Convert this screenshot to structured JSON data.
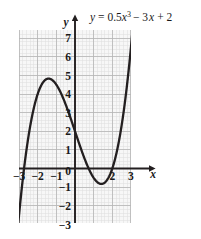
{
  "chart_data": {
    "type": "line",
    "title": "",
    "equation_label": "y = 0.5x³ − 3x + 2",
    "equation_parts": {
      "y": "y",
      "equals": "= 0.5",
      "x1": "x",
      "exp": "3",
      "mid": "− 3",
      "x2": "x",
      "end": "+ 2"
    },
    "function": "y = 0.5*x^3 - 3*x + 2",
    "xlabel": "x",
    "ylabel": "y",
    "xlim": [
      -3.2,
      3.35
    ],
    "ylim": [
      -3.2,
      7.3
    ],
    "x_ticks": [
      -3,
      -2,
      -1,
      0,
      2,
      3
    ],
    "x_tick_labels": [
      "-3",
      "-2",
      "-1",
      "0",
      "2",
      "3"
    ],
    "y_ticks": [
      7,
      6,
      5,
      4,
      3,
      2,
      1,
      -1,
      -2,
      -3
    ],
    "y_tick_labels": [
      "7",
      "6",
      "5",
      "4",
      "3",
      "2",
      "1",
      "-1",
      "-2",
      "-3"
    ],
    "grid": true,
    "minor_grid": true,
    "major_grid_step": 1,
    "minor_grid_step": 0.2,
    "legend": "none",
    "curve_color": "#231f20",
    "grid_major_color": "#b9b9b9",
    "grid_minor_color": "#dcdcdc",
    "plot_background": "#f7f7f7",
    "axis_color": "#231f20",
    "key_points": {
      "y_intercept": {
        "x": 0,
        "y": 2
      },
      "local_maximum": {
        "x": -1.414,
        "y": 4.83
      },
      "local_minimum": {
        "x": 1.414,
        "y": -0.83
      },
      "roots": [
        -2.89,
        0.74,
        2.15
      ]
    },
    "points": [
      {
        "x": -3.15,
        "y": -4.17
      },
      {
        "x": -3.0,
        "y": -2.5
      },
      {
        "x": -2.8,
        "y": -0.58
      },
      {
        "x": -2.6,
        "y": 1.01
      },
      {
        "x": -2.4,
        "y": 2.29
      },
      {
        "x": -2.2,
        "y": 3.28
      },
      {
        "x": -2.0,
        "y": 4.0
      },
      {
        "x": -1.8,
        "y": 4.48
      },
      {
        "x": -1.6,
        "y": 4.75
      },
      {
        "x": -1.414,
        "y": 4.83
      },
      {
        "x": -1.2,
        "y": 4.74
      },
      {
        "x": -1.0,
        "y": 4.5
      },
      {
        "x": -0.8,
        "y": 4.14
      },
      {
        "x": -0.6,
        "y": 3.69
      },
      {
        "x": -0.4,
        "y": 3.17
      },
      {
        "x": -0.2,
        "y": 2.6
      },
      {
        "x": 0.0,
        "y": 2.0
      },
      {
        "x": 0.2,
        "y": 1.4
      },
      {
        "x": 0.4,
        "y": 0.83
      },
      {
        "x": 0.6,
        "y": 0.31
      },
      {
        "x": 0.8,
        "y": -0.14
      },
      {
        "x": 1.0,
        "y": -0.5
      },
      {
        "x": 1.2,
        "y": -0.74
      },
      {
        "x": 1.414,
        "y": -0.83
      },
      {
        "x": 1.6,
        "y": -0.75
      },
      {
        "x": 1.8,
        "y": -0.48
      },
      {
        "x": 2.0,
        "y": 0.0
      },
      {
        "x": 2.2,
        "y": 0.72
      },
      {
        "x": 2.4,
        "y": 1.71
      },
      {
        "x": 2.6,
        "y": 2.99
      },
      {
        "x": 2.8,
        "y": 4.58
      },
      {
        "x": 2.9,
        "y": 5.5
      },
      {
        "x": 3.0,
        "y": 6.5
      },
      {
        "x": 3.08,
        "y": 7.35
      }
    ]
  }
}
